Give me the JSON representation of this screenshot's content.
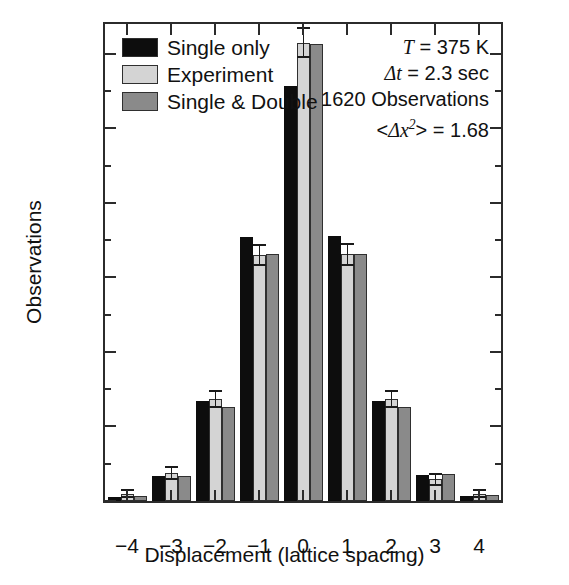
{
  "chart_data": {
    "type": "bar",
    "title": "",
    "xlabel": "Displacement (lattice spacing)",
    "ylabel": "Observations",
    "categories": [
      "-4",
      "-3",
      "-2",
      "-1",
      "0",
      "1",
      "2",
      "3",
      "4"
    ],
    "ylim": [
      0,
      640
    ],
    "xlim": [
      -4.6,
      4.6
    ],
    "grid": false,
    "legend_position": "top-left",
    "y_ticks_major": [
      0,
      100,
      200,
      300,
      400,
      500,
      600
    ],
    "y_ticks_minor": [
      50,
      150,
      250,
      350,
      450,
      550
    ],
    "x_ticks": [
      -4,
      -3,
      -2,
      -1,
      0,
      1,
      2,
      3,
      4
    ],
    "series": [
      {
        "name": "Single only",
        "color": "#0d0d0d",
        "values": [
          6,
          33,
          134,
          354,
          557,
          355,
          134,
          35,
          7
        ],
        "errors": [
          0,
          0,
          0,
          0,
          0,
          0,
          0,
          0,
          0
        ]
      },
      {
        "name": "Experiment",
        "color": "#d4d4d4",
        "values": [
          10,
          37,
          137,
          330,
          615,
          331,
          137,
          29,
          10
        ],
        "errors": [
          5,
          8,
          11,
          14,
          19,
          14,
          11,
          7,
          5
        ]
      },
      {
        "name": "Single & Double",
        "color": "#8a8a8a",
        "values": [
          7,
          34,
          126,
          332,
          613,
          332,
          126,
          36,
          8
        ],
        "errors": [
          0,
          0,
          0,
          0,
          0,
          0,
          0,
          0,
          0
        ]
      }
    ],
    "annotations": [
      {
        "id": "temperature",
        "text": "T = 375 K"
      },
      {
        "id": "time-step",
        "text": "Δt = 2.3 sec"
      },
      {
        "id": "observations",
        "text": "1620 Observations"
      },
      {
        "id": "mean-square",
        "text": "<Δx² > = 1.68"
      }
    ]
  },
  "legend": {
    "items": [
      {
        "label": "Single only",
        "swatch": "#0d0d0d"
      },
      {
        "label": "Experiment",
        "swatch": "#d4d4d4"
      },
      {
        "label": "Single & Double",
        "swatch": "#8a8a8a"
      }
    ]
  },
  "notes": {
    "temperature_symbol": "T",
    "temperature_value": " = 375 K",
    "delta_symbol": "Δ",
    "time_symbol": "t",
    "time_value": " = 2.3 sec",
    "observations": "1620 Observations",
    "msd_open": "<",
    "msd_delta": "Δ",
    "msd_var": "x",
    "msd_exp": "2",
    "msd_close": "> = 1.68"
  }
}
